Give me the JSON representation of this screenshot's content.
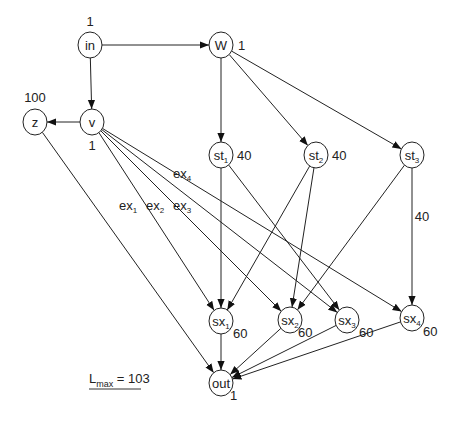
{
  "diagram": {
    "nodes": [
      {
        "id": "in",
        "label": "in",
        "sub": "",
        "x": 90,
        "y": 45,
        "weight": "1",
        "wx": 90,
        "wy": 26,
        "anchor": "middle"
      },
      {
        "id": "W",
        "label": "W",
        "sub": "",
        "x": 221,
        "y": 45,
        "weight": "1",
        "wx": 238,
        "wy": 50,
        "anchor": "start"
      },
      {
        "id": "v",
        "label": "v",
        "sub": "",
        "x": 92,
        "y": 122,
        "weight": "1",
        "wx": 92,
        "wy": 150,
        "anchor": "middle"
      },
      {
        "id": "z",
        "label": "z",
        "sub": "",
        "x": 35,
        "y": 122,
        "weight": "100",
        "wx": 35,
        "wy": 102,
        "anchor": "middle"
      },
      {
        "id": "st1",
        "label": "st",
        "sub": "1",
        "x": 221,
        "y": 155,
        "weight": "40",
        "wx": 237,
        "wy": 160,
        "anchor": "start"
      },
      {
        "id": "st2",
        "label": "st",
        "sub": "2",
        "x": 316,
        "y": 155,
        "weight": "40",
        "wx": 332,
        "wy": 160,
        "anchor": "start"
      },
      {
        "id": "st3",
        "label": "st",
        "sub": "3",
        "x": 412,
        "y": 155,
        "weight": "",
        "wx": 0,
        "wy": 0,
        "anchor": "start"
      },
      {
        "id": "sx1",
        "label": "sx",
        "sub": "1",
        "x": 221,
        "y": 321,
        "weight": "60",
        "wx": 233,
        "wy": 338,
        "anchor": "start"
      },
      {
        "id": "sx2",
        "label": "sx",
        "sub": "2",
        "x": 290,
        "y": 320,
        "weight": "60",
        "wx": 298,
        "wy": 337,
        "anchor": "start"
      },
      {
        "id": "sx3",
        "label": "sx",
        "sub": "3",
        "x": 347,
        "y": 320,
        "weight": "60",
        "wx": 359,
        "wy": 337,
        "anchor": "start"
      },
      {
        "id": "sx4",
        "label": "sx",
        "sub": "4",
        "x": 412,
        "y": 318,
        "weight": "60",
        "wx": 423,
        "wy": 336,
        "anchor": "start"
      },
      {
        "id": "out",
        "label": "out",
        "sub": "",
        "x": 221,
        "y": 383,
        "weight": "1",
        "wx": 230,
        "wy": 400,
        "anchor": "start"
      }
    ],
    "edges": [
      {
        "from": "in",
        "to": "W"
      },
      {
        "from": "in",
        "to": "v"
      },
      {
        "from": "v",
        "to": "z"
      },
      {
        "from": "W",
        "to": "st1"
      },
      {
        "from": "W",
        "to": "st2"
      },
      {
        "from": "W",
        "to": "st3"
      },
      {
        "from": "v",
        "to": "sx1"
      },
      {
        "from": "v",
        "to": "sx2"
      },
      {
        "from": "v",
        "to": "sx3"
      },
      {
        "from": "v",
        "to": "sx4"
      },
      {
        "from": "st1",
        "to": "sx1"
      },
      {
        "from": "st1",
        "to": "sx3"
      },
      {
        "from": "st2",
        "to": "sx1"
      },
      {
        "from": "st2",
        "to": "sx2"
      },
      {
        "from": "st3",
        "to": "sx2"
      },
      {
        "from": "st3",
        "to": "sx4"
      },
      {
        "from": "z",
        "to": "out"
      },
      {
        "from": "sx1",
        "to": "out"
      },
      {
        "from": "sx2",
        "to": "out"
      },
      {
        "from": "sx3",
        "to": "out"
      },
      {
        "from": "sx4",
        "to": "out"
      }
    ],
    "edge_labels": [
      {
        "text": "ex",
        "sub": "1",
        "x": 128,
        "y": 210
      },
      {
        "text": "ex",
        "sub": "2",
        "x": 155,
        "y": 210
      },
      {
        "text": "ex",
        "sub": "3",
        "x": 182,
        "y": 210
      },
      {
        "text": "ex",
        "sub": "4",
        "x": 182,
        "y": 178
      },
      {
        "text": "40",
        "sub": "",
        "x": 422,
        "y": 221
      }
    ],
    "lmax": {
      "base": "L",
      "sub": "max",
      "rest": " = 103"
    }
  }
}
